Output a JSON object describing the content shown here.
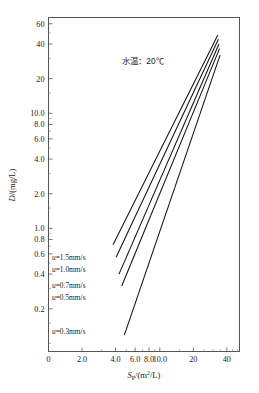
{
  "chart_data": {
    "type": "line",
    "title": "",
    "annotation": "水温：20℃",
    "xlabel": "S_P/(m²/L)",
    "xlabel_parts": {
      "main": "S",
      "sub": "P",
      "rest": "/(m",
      "sup": "2",
      "tail": "/L)"
    },
    "ylabel": "D/(mg/L)",
    "ylabel_parts": {
      "main": "D",
      "rest": "/(mg/L)"
    },
    "xscale": "log",
    "yscale": "log",
    "xlim": [
      1.0,
      52.0
    ],
    "ylim": [
      0.085,
      68.0
    ],
    "grid": false,
    "legend_position": "inside-left",
    "xticks": [
      {
        "value": 1.0,
        "label": "0"
      },
      {
        "value": 2.0,
        "label": "2.0"
      },
      {
        "value": 4.0,
        "label": "4.0"
      },
      {
        "value": 6.0,
        "label": "6.0"
      },
      {
        "value": 8.0,
        "label": "8.0"
      },
      {
        "value": 10.0,
        "label": "10.0"
      },
      {
        "value": 20.0,
        "label": "20"
      },
      {
        "value": 40.0,
        "label": "40"
      }
    ],
    "xminorticks": [
      3.0,
      5.0,
      7.0,
      9.0,
      15.0,
      25.0,
      30.0,
      35.0,
      45.0,
      50.0
    ],
    "yticks": [
      {
        "value": 60.0,
        "label": "60"
      },
      {
        "value": 40.0,
        "label": "40"
      },
      {
        "value": 20.0,
        "label": "20"
      },
      {
        "value": 10.0,
        "label": "10.0"
      },
      {
        "value": 8.0,
        "label": "8.0"
      },
      {
        "value": 6.0,
        "label": "6.0"
      },
      {
        "value": 4.0,
        "label": "4.0"
      },
      {
        "value": 2.0,
        "label": "2.0"
      },
      {
        "value": 1.0,
        "label": "1.0"
      },
      {
        "value": 0.8,
        "label": "0.8"
      },
      {
        "value": 0.6,
        "label": "0.6"
      },
      {
        "value": 0.4,
        "label": "0.4"
      },
      {
        "value": 0.2,
        "label": "0.2"
      }
    ],
    "yminorticks": [
      50.0,
      30.0,
      15.0,
      9.0,
      7.0,
      5.0,
      3.0,
      1.5,
      0.9,
      0.7,
      0.5,
      0.3,
      0.15,
      0.1
    ],
    "series": [
      {
        "name": "u=1.5mm/s",
        "u_value": 1.5,
        "unit": "mm/s",
        "points": [
          [
            3.8,
            0.72
          ],
          [
            33.2,
            48.0
          ]
        ],
        "label": "u=1.5mm/s"
      },
      {
        "name": "u=1.0mm/s",
        "u_value": 1.0,
        "unit": "mm/s",
        "points": [
          [
            4.05,
            0.56
          ],
          [
            33.6,
            44.0
          ]
        ],
        "label": "u=1.0mm/s"
      },
      {
        "name": "u=0.7mm/s",
        "u_value": 0.7,
        "unit": "mm/s",
        "points": [
          [
            4.3,
            0.4
          ],
          [
            34.0,
            40.0
          ]
        ],
        "label": "u=0.7mm/s"
      },
      {
        "name": "u=0.5mm/s",
        "u_value": 0.5,
        "unit": "mm/s",
        "points": [
          [
            4.55,
            0.315
          ],
          [
            34.4,
            36.5
          ]
        ],
        "label": "u=0.5mm/s"
      },
      {
        "name": "u=0.3mm/s",
        "u_value": 0.3,
        "unit": "mm/s",
        "points": [
          [
            4.8,
            0.118
          ],
          [
            34.8,
            32.0
          ]
        ],
        "label": "u=0.3mm/s"
      }
    ],
    "series_label_anchors": [
      {
        "x": 52,
        "y": 260
      },
      {
        "x": 52,
        "y": 272
      },
      {
        "x": 52,
        "y": 288
      },
      {
        "x": 52,
        "y": 300
      },
      {
        "x": 52,
        "y": 334
      }
    ],
    "colors": {
      "line": "#111111",
      "axis": "#555555",
      "text": "#1a1a1a",
      "background": "#ffffff"
    }
  }
}
